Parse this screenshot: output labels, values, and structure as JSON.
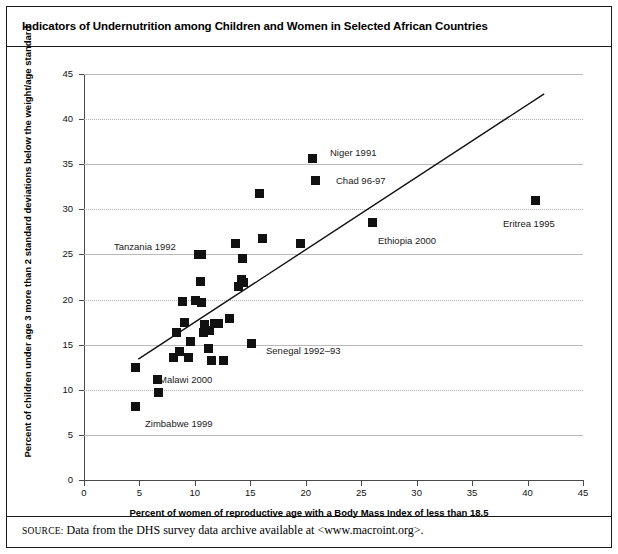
{
  "figure": {
    "title": "Indicators of Undernutrition among Children and Women in Selected African Countries",
    "source_prefix": "SOURCE:",
    "source_text": "Data from the DHS survey data archive available at <www.macroint.org>."
  },
  "chart_data": {
    "type": "scatter",
    "title": "Indicators of Undernutrition among Children and Women in Selected African Countries",
    "xlabel": "Percent of women of reproductive age with a Body Mass Index of less than 18.5",
    "ylabel": "Percent of children under age 3 more than 2 standard deviations below the weight/age standard",
    "xlim": [
      0,
      45
    ],
    "ylim": [
      0,
      45
    ],
    "xticks": [
      0,
      5,
      10,
      15,
      20,
      25,
      30,
      35,
      40,
      45
    ],
    "yticks": [
      0,
      5,
      10,
      15,
      20,
      25,
      30,
      35,
      40,
      45
    ],
    "grid": "horizontal",
    "legend": "none",
    "marker_color": "#111111",
    "trendline": {
      "x": [
        4.9,
        41.5
      ],
      "y": [
        13.4,
        42.8
      ],
      "color": "#111111"
    },
    "points": [
      {
        "x": 4.6,
        "y": 8.1
      },
      {
        "x": 4.6,
        "y": 12.5
      },
      {
        "x": 6.6,
        "y": 11.1
      },
      {
        "x": 6.7,
        "y": 9.7
      },
      {
        "x": 8.1,
        "y": 13.6
      },
      {
        "x": 8.3,
        "y": 16.4
      },
      {
        "x": 8.6,
        "y": 14.2
      },
      {
        "x": 8.9,
        "y": 19.8
      },
      {
        "x": 9.1,
        "y": 17.5
      },
      {
        "x": 9.4,
        "y": 13.6
      },
      {
        "x": 9.6,
        "y": 15.4
      },
      {
        "x": 10.1,
        "y": 19.9
      },
      {
        "x": 10.3,
        "y": 25.0
      },
      {
        "x": 10.5,
        "y": 22.0
      },
      {
        "x": 10.6,
        "y": 19.7
      },
      {
        "x": 10.6,
        "y": 25.0
      },
      {
        "x": 10.8,
        "y": 16.4
      },
      {
        "x": 10.9,
        "y": 17.2
      },
      {
        "x": 11.2,
        "y": 14.6
      },
      {
        "x": 11.3,
        "y": 16.6
      },
      {
        "x": 11.5,
        "y": 13.3
      },
      {
        "x": 11.8,
        "y": 17.3
      },
      {
        "x": 12.1,
        "y": 17.4
      },
      {
        "x": 12.6,
        "y": 13.2
      },
      {
        "x": 13.1,
        "y": 17.9
      },
      {
        "x": 13.7,
        "y": 26.2
      },
      {
        "x": 13.9,
        "y": 21.5
      },
      {
        "x": 14.2,
        "y": 22.2
      },
      {
        "x": 14.3,
        "y": 24.5
      },
      {
        "x": 14.4,
        "y": 21.9
      },
      {
        "x": 15.1,
        "y": 15.1
      },
      {
        "x": 15.8,
        "y": 31.7
      },
      {
        "x": 16.1,
        "y": 26.8
      },
      {
        "x": 19.5,
        "y": 26.2
      },
      {
        "x": 20.6,
        "y": 35.6
      },
      {
        "x": 20.9,
        "y": 33.2
      },
      {
        "x": 26.0,
        "y": 28.5
      },
      {
        "x": 40.7,
        "y": 31.0
      }
    ],
    "annotations": [
      {
        "label": "Tanzania 1992",
        "x": 10.4,
        "y": 25.0,
        "label_x": 114,
        "label_y": 242
      },
      {
        "label": "Niger 1991",
        "x": 20.6,
        "y": 35.6,
        "label_x": 330,
        "label_y": 148
      },
      {
        "label": "Chad 96-97",
        "x": 20.9,
        "y": 33.2,
        "label_x": 336,
        "label_y": 176
      },
      {
        "label": "Ethiopia 2000",
        "x": 26.0,
        "y": 28.5,
        "label_x": 378,
        "label_y": 236
      },
      {
        "label": "Eritrea 1995",
        "x": 40.7,
        "y": 31.0,
        "label_x": 503,
        "label_y": 219
      },
      {
        "label": "Senegal 1992–93",
        "x": 15.1,
        "y": 15.1,
        "label_x": 266,
        "label_y": 346
      },
      {
        "label": "Malawi 2000",
        "x": 6.6,
        "y": 11.1,
        "label_x": 159,
        "label_y": 375
      },
      {
        "label": "Zimbabwe 1999",
        "x": 4.6,
        "y": 8.1,
        "label_x": 145,
        "label_y": 419
      }
    ]
  }
}
